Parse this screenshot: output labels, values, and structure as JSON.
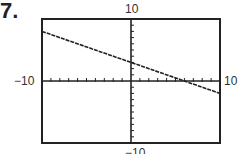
{
  "problem_number": "7.",
  "window": {
    "xmin_label": "−10",
    "xmax_label": "10",
    "ymax_label": "10",
    "ymin_label": "−10"
  },
  "chart_data": {
    "type": "line",
    "title": "",
    "xlabel": "",
    "ylabel": "",
    "xlim": [
      -10,
      10
    ],
    "ylim": [
      -10,
      10
    ],
    "xscale_ticks": 1,
    "yscale_ticks": 1,
    "grid": false,
    "legend": null,
    "series": [
      {
        "name": "graphed line",
        "x": [
          -10,
          10
        ],
        "y": [
          8,
          -2
        ],
        "equation_estimate": "y = -0.5x + 3"
      }
    ],
    "annotations": [
      "-10",
      "10",
      "10",
      "-10"
    ]
  }
}
